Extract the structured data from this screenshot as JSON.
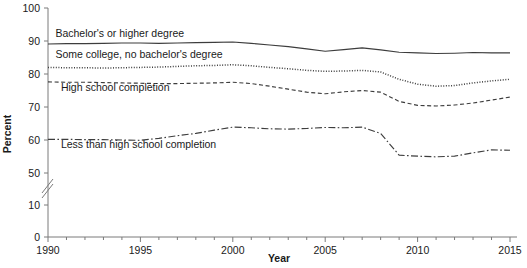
{
  "chart_data": {
    "type": "line",
    "title": "",
    "xlabel": "Year",
    "ylabel": "Percent",
    "xlim": [
      1990,
      2015
    ],
    "ylim": [
      0,
      100
    ],
    "grid": false,
    "legend_position": "inline-annotations",
    "axis_break": {
      "from": 10,
      "to": 50,
      "label": "y-axis break between 10 and 50"
    },
    "ytick_labels": [
      "0",
      "10",
      "50",
      "60",
      "70",
      "80",
      "90",
      "100"
    ],
    "ytick_values": [
      0,
      10,
      50,
      60,
      70,
      80,
      90,
      100
    ],
    "xtick_labels": [
      "1990",
      "1995",
      "2000",
      "2005",
      "2010",
      "2015"
    ],
    "xtick_values": [
      1990,
      1995,
      2000,
      2005,
      2010,
      2015
    ],
    "x": [
      1990,
      1991,
      1992,
      1993,
      1994,
      1995,
      1996,
      1997,
      1998,
      1999,
      2000,
      2001,
      2002,
      2003,
      2004,
      2005,
      2006,
      2007,
      2008,
      2009,
      2010,
      2011,
      2012,
      2013,
      2014,
      2015
    ],
    "series": [
      {
        "name": "Bachelor's or higher degree",
        "style": "solid",
        "color": "#3d3d3d",
        "values": [
          89.1,
          89.2,
          89.2,
          89.3,
          89.4,
          89.4,
          89.3,
          89.4,
          89.5,
          89.6,
          89.7,
          89.3,
          88.8,
          88.3,
          87.6,
          86.9,
          87.4,
          87.9,
          87.3,
          86.6,
          86.4,
          86.2,
          86.3,
          86.5,
          86.4,
          86.4
        ]
      },
      {
        "name": "Some college, no bachelor's degree",
        "style": "dotted",
        "color": "#3d3d3d",
        "values": [
          82.0,
          81.9,
          81.9,
          81.8,
          81.9,
          82.0,
          82.1,
          82.3,
          82.5,
          82.6,
          82.8,
          82.5,
          82.0,
          81.6,
          81.1,
          80.8,
          80.9,
          81.1,
          80.6,
          78.4,
          76.9,
          76.3,
          76.5,
          77.3,
          77.9,
          78.4
        ]
      },
      {
        "name": "High school completion",
        "style": "dashed",
        "color": "#3d3d3d",
        "values": [
          77.6,
          77.5,
          77.5,
          77.4,
          77.3,
          77.2,
          77.1,
          77.1,
          77.2,
          77.3,
          77.5,
          77.1,
          76.3,
          75.4,
          74.5,
          74.0,
          74.6,
          75.0,
          74.5,
          71.7,
          70.5,
          70.3,
          70.6,
          71.2,
          72.1,
          73.0
        ]
      },
      {
        "name": "Less than high school completion",
        "style": "dashdot",
        "color": "#3d3d3d",
        "values": [
          60.2,
          60.2,
          60.1,
          60.1,
          60.0,
          59.9,
          60.5,
          61.3,
          62.0,
          63.0,
          63.9,
          63.7,
          63.4,
          63.3,
          63.5,
          63.8,
          63.7,
          63.9,
          62.0,
          55.4,
          55.1,
          54.9,
          55.1,
          56.1,
          57.0,
          56.9
        ]
      }
    ],
    "annotations": [
      {
        "text": "Bachelor's or higher degree",
        "x": 1990.4,
        "y": 91.3
      },
      {
        "text": "Some college, no bachelor's degree",
        "x": 1990.4,
        "y": 85.0
      },
      {
        "text": "High school completion",
        "x": 1990.7,
        "y": 75.0
      },
      {
        "text": "Less than high school completion",
        "x": 1990.7,
        "y": 57.5
      }
    ]
  }
}
